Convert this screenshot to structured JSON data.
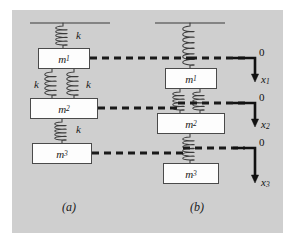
{
  "figure": {
    "background_color": "#ffffff",
    "panel_color": "#cfcfcf",
    "panel": {
      "x": 12,
      "y": 10,
      "width": 271,
      "height": 223
    },
    "line_color": "#3a3a3a",
    "dashed_color": "#1a1a1a",
    "box_fill": "#fdfdfd",
    "box_stroke": "#4a4a4a"
  },
  "diagram_a": {
    "caption": "(a)",
    "caption_pos": {
      "x": 62,
      "y": 200
    },
    "support": {
      "x1": 30,
      "x2": 110,
      "y": 23
    },
    "masses": [
      {
        "label": "m",
        "sub": "1",
        "x": 38,
        "y": 48,
        "width": 52,
        "height": 21
      },
      {
        "label": "m",
        "sub": "2",
        "x": 30,
        "y": 98,
        "width": 68,
        "height": 21
      },
      {
        "label": "m",
        "sub": "3",
        "x": 32,
        "y": 143,
        "width": 60,
        "height": 21
      }
    ],
    "springs": [
      {
        "name": "spring-ceiling-m1",
        "cx": 63,
        "top": 23,
        "bottom": 48,
        "coils": 5,
        "label": "k",
        "label_x": 76,
        "label_y": 29
      },
      {
        "name": "spring-m1-m2-left",
        "cx": 52,
        "top": 69,
        "bottom": 98,
        "coils": 5,
        "label": "k",
        "label_x": 34,
        "label_y": 78
      },
      {
        "name": "spring-m1-m2-right",
        "cx": 74,
        "top": 69,
        "bottom": 98,
        "coils": 5,
        "label": "k",
        "label_x": 86,
        "label_y": 78
      },
      {
        "name": "spring-m2-m3",
        "cx": 62,
        "top": 119,
        "bottom": 143,
        "coils": 5,
        "label": "k",
        "label_x": 76,
        "label_y": 123
      }
    ],
    "dashed_lines": [
      {
        "name": "dashed-m1",
        "y": 58,
        "x1": 90,
        "x2": 190
      },
      {
        "name": "dashed-m2",
        "y": 108,
        "x1": 98,
        "x2": 178
      },
      {
        "name": "dashed-m3",
        "y": 153,
        "x1": 92,
        "x2": 183
      }
    ]
  },
  "diagram_b": {
    "caption": "(b)",
    "caption_pos": {
      "x": 190,
      "y": 200
    },
    "support": {
      "x1": 155,
      "x2": 225,
      "y": 23
    },
    "masses": [
      {
        "label": "m",
        "sub": "1",
        "x": 165,
        "y": 68,
        "width": 52,
        "height": 21
      },
      {
        "label": "m",
        "sub": "2",
        "x": 157,
        "y": 113,
        "width": 68,
        "height": 21
      },
      {
        "label": "m",
        "sub": "3",
        "x": 163,
        "y": 163,
        "width": 56,
        "height": 21
      }
    ],
    "springs": [
      {
        "name": "spring-ceiling-m1",
        "cx": 190,
        "top": 23,
        "bottom": 68,
        "coils": 7
      },
      {
        "name": "spring-m1-m2-left",
        "cx": 180,
        "top": 89,
        "bottom": 113,
        "coils": 5
      },
      {
        "name": "spring-m1-m2-right",
        "cx": 200,
        "top": 89,
        "bottom": 113,
        "coils": 5
      },
      {
        "name": "spring-m2-m3",
        "cx": 190,
        "top": 134,
        "bottom": 163,
        "coils": 6
      }
    ],
    "dashed_lines": [
      {
        "name": "dashed-ref-1",
        "y": 58,
        "x1": 190,
        "x2": 245
      },
      {
        "name": "dashed-ref-2",
        "y": 103,
        "x1": 178,
        "x2": 245
      },
      {
        "name": "dashed-ref-3",
        "y": 148,
        "x1": 183,
        "x2": 245
      }
    ],
    "axes": [
      {
        "name": "axis-x1",
        "corner_x": 255,
        "y": 58,
        "arrow_tip_y": 82,
        "origin_label": "0",
        "origin_label_pos": {
          "x": 259,
          "y": 46
        },
        "variable": "x",
        "variable_sub": "1",
        "variable_pos": {
          "x": 261,
          "y": 73
        }
      },
      {
        "name": "axis-x2",
        "corner_x": 255,
        "y": 103,
        "arrow_tip_y": 127,
        "origin_label": "0",
        "origin_label_pos": {
          "x": 259,
          "y": 91
        },
        "variable": "x",
        "variable_sub": "2",
        "variable_pos": {
          "x": 261,
          "y": 118
        }
      },
      {
        "name": "axis-x3",
        "corner_x": 255,
        "y": 148,
        "arrow_tip_y": 183,
        "origin_label": "0",
        "origin_label_pos": {
          "x": 259,
          "y": 136
        },
        "variable": "x",
        "variable_sub": "3",
        "variable_pos": {
          "x": 261,
          "y": 176
        }
      }
    ]
  }
}
